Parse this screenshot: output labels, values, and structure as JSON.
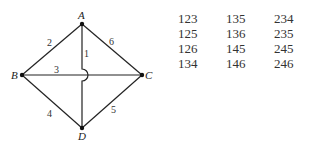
{
  "graph": {
    "vertices": [
      {
        "id": "A",
        "label": "A",
        "x": 82,
        "y": 24
      },
      {
        "id": "B",
        "label": "B",
        "x": 22,
        "y": 75
      },
      {
        "id": "C",
        "label": "C",
        "x": 142,
        "y": 75
      },
      {
        "id": "D",
        "label": "D",
        "x": 82,
        "y": 128
      }
    ],
    "edges": [
      {
        "label": "1",
        "from": "A",
        "to": "D",
        "note": "vertical, bridges over edge 3"
      },
      {
        "label": "2",
        "from": "A",
        "to": "B"
      },
      {
        "label": "3",
        "from": "B",
        "to": "C"
      },
      {
        "label": "4",
        "from": "B",
        "to": "D"
      },
      {
        "label": "5",
        "from": "D",
        "to": "C"
      },
      {
        "label": "6",
        "from": "A",
        "to": "C"
      }
    ]
  },
  "table": {
    "rows": [
      [
        "123",
        "135",
        "234"
      ],
      [
        "125",
        "136",
        "235"
      ],
      [
        "126",
        "145",
        "245"
      ],
      [
        "134",
        "146",
        "246"
      ]
    ]
  }
}
